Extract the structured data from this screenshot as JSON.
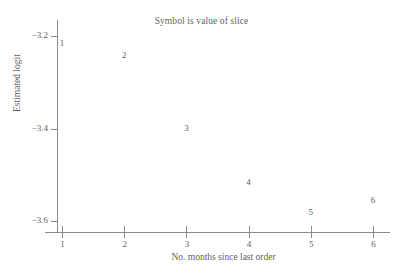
{
  "chart_data": {
    "type": "scatter",
    "title": "Symbol is value of slice",
    "xlabel": "No. months since last order",
    "ylabel": "Estimated logit",
    "grid": false,
    "legend": "none",
    "point_marker_style": "numeric-text-symbol",
    "marker_note": "Each plotted point is drawn as the digit of its slice value instead of a marker glyph",
    "xlim": [
      0.8,
      6.3
    ],
    "ylim": [
      -3.63,
      -3.17
    ],
    "xticks": [
      1,
      2,
      3,
      4,
      5,
      6
    ],
    "xtick_labels": [
      "1",
      "2",
      "3",
      "4",
      "5",
      "6"
    ],
    "yticks": [
      -3.2,
      -3.4,
      -3.6
    ],
    "ytick_labels": [
      "−3.2",
      "−3.4",
      "−3.6"
    ],
    "x": [
      1,
      2,
      3,
      4,
      5,
      6
    ],
    "values": [
      -3.215,
      -3.241,
      -3.399,
      -3.516,
      -3.58,
      -3.554
    ],
    "point_symbols": [
      "1",
      "2",
      "3",
      "4",
      "5",
      "6"
    ],
    "points": [
      {
        "symbol": "1",
        "x": 1,
        "y": -3.215
      },
      {
        "symbol": "2",
        "x": 2,
        "y": -3.241
      },
      {
        "symbol": "3",
        "x": 3,
        "y": -3.399
      },
      {
        "symbol": "4",
        "x": 4,
        "y": -3.516
      },
      {
        "symbol": "5",
        "x": 5,
        "y": -3.58
      },
      {
        "symbol": "6",
        "x": 6,
        "y": -3.554
      }
    ],
    "axis_color": "#8a8a8a",
    "text_color": "#5a5a5a"
  }
}
